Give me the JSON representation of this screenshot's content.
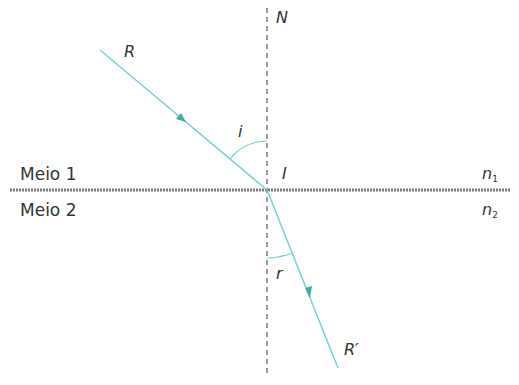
{
  "diagram": {
    "type": "refraction",
    "labels": {
      "normal": "N",
      "incident_ray": "R",
      "refracted_ray": "R′",
      "incidence_point": "I",
      "incidence_angle": "i",
      "refraction_angle": "r",
      "medium_1": "Meio 1",
      "medium_2": "Meio 2",
      "n1_base": "n",
      "n1_sub": "1",
      "n2_base": "n",
      "n2_sub": "2"
    },
    "colors": {
      "ray": "#6cd0d8",
      "interface": "#777777",
      "normal": "#666666",
      "text": "#333333"
    }
  }
}
